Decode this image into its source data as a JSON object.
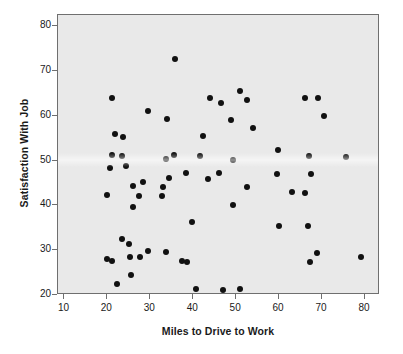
{
  "chart_data": {
    "type": "scatter",
    "title": "",
    "xlabel": "Miles to Drive to Work",
    "ylabel": "Satisfaction With Job",
    "xlim": [
      8.5,
      83.5
    ],
    "ylim": [
      20,
      82.5
    ],
    "xticks": [
      10,
      20,
      30,
      40,
      50,
      60,
      70,
      80
    ],
    "yticks": [
      20,
      30,
      40,
      50,
      60,
      70,
      80
    ],
    "xtick_labels": [
      "10",
      "20",
      "30",
      "40",
      "50",
      "60",
      "70",
      "80"
    ],
    "ytick_labels": [
      "20",
      "30",
      "40",
      "50",
      "60",
      "70",
      "80"
    ],
    "grid": false,
    "legend": null,
    "marker": "filled-circle",
    "marker_color": "#111111",
    "plot_background": "#e9e9e9",
    "n_points": 74,
    "points": [
      [
        21.0,
        64.0
      ],
      [
        29.4,
        61.0
      ],
      [
        21.7,
        56.0
      ],
      [
        23.6,
        55.2
      ],
      [
        21.0,
        51.2
      ],
      [
        23.5,
        51.1
      ],
      [
        20.7,
        48.4
      ],
      [
        24.4,
        48.9
      ],
      [
        19.9,
        42.3
      ],
      [
        25.9,
        44.3
      ],
      [
        28.4,
        45.2
      ],
      [
        27.3,
        42.0
      ],
      [
        26.0,
        39.6
      ],
      [
        23.3,
        32.5
      ],
      [
        25.0,
        31.4
      ],
      [
        20.0,
        28.1
      ],
      [
        21.0,
        27.6
      ],
      [
        25.3,
        28.4
      ],
      [
        27.6,
        28.5
      ],
      [
        29.4,
        29.8
      ],
      [
        25.6,
        24.5
      ],
      [
        22.2,
        22.4
      ],
      [
        33.8,
        59.2
      ],
      [
        33.6,
        50.3
      ],
      [
        35.5,
        51.3
      ],
      [
        34.4,
        46.2
      ],
      [
        33.0,
        44.0
      ],
      [
        32.8,
        42.0
      ],
      [
        35.8,
        72.6
      ],
      [
        38.3,
        47.2
      ],
      [
        39.8,
        36.4
      ],
      [
        33.6,
        29.7
      ],
      [
        37.4,
        27.5
      ],
      [
        38.6,
        27.3
      ],
      [
        40.6,
        21.4
      ],
      [
        44.0,
        64.0
      ],
      [
        46.5,
        62.9
      ],
      [
        42.3,
        55.5
      ],
      [
        41.5,
        51.1
      ],
      [
        43.5,
        46.0
      ],
      [
        46.0,
        47.2
      ],
      [
        49.2,
        50.2
      ],
      [
        48.9,
        59.0
      ],
      [
        51.0,
        65.5
      ],
      [
        52.5,
        63.5
      ],
      [
        54.0,
        57.2
      ],
      [
        52.5,
        44.1
      ],
      [
        49.2,
        40.2
      ],
      [
        47.0,
        21.1
      ],
      [
        51.0,
        21.3
      ],
      [
        59.8,
        52.4
      ],
      [
        59.6,
        46.9
      ],
      [
        63.0,
        42.9
      ],
      [
        59.9,
        35.4
      ],
      [
        66.0,
        64.0
      ],
      [
        69.0,
        64.0
      ],
      [
        70.5,
        59.9
      ],
      [
        67.0,
        51.0
      ],
      [
        67.4,
        46.9
      ],
      [
        66.0,
        42.8
      ],
      [
        66.8,
        35.3
      ],
      [
        68.8,
        29.4
      ],
      [
        67.2,
        27.4
      ],
      [
        75.6,
        50.8
      ],
      [
        79.0,
        28.4
      ]
    ]
  },
  "axis": {
    "y_title": "Satisfaction With Job",
    "x_title": "Miles to Drive to Work"
  }
}
